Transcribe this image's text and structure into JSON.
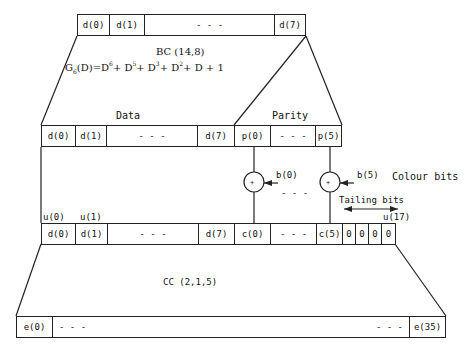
{
  "diagram": {
    "top_row": {
      "cells": [
        "d(0)",
        "d(1)",
        "- - -",
        "d(7)"
      ]
    },
    "bc_block": {
      "label": "BC (14,8)",
      "generator_prefix": "G",
      "generator_sub": "6",
      "generator_body": "(D)=D",
      "exp1": "6",
      "t1": "+ D",
      "exp2": "5",
      "t2": "+ D",
      "exp3": "3",
      "t3": "+ D",
      "exp4": "2",
      "t4": "+ D + 1"
    },
    "middle_row": {
      "data_label": "Data",
      "parity_label": "Parity",
      "cells": [
        "d(0)",
        "d(1)",
        "- - -",
        "d(7)",
        "p(0)",
        "- - -",
        "p(5)"
      ]
    },
    "xor": {
      "symbol": "+",
      "inputs": [
        "b(0)",
        "b(5)"
      ],
      "between": "- - -",
      "group_label": "Colour bits"
    },
    "tailing": {
      "label": "Tailing bits"
    },
    "lower_row": {
      "index_labels": [
        "u(0)",
        "u(1)",
        "u(17)"
      ],
      "cells": [
        "d(0)",
        "d(1)",
        "- - -",
        "d(7)",
        "c(0)",
        "- - -",
        "c(5)",
        "0",
        "0",
        "0",
        "0"
      ]
    },
    "cc_block": {
      "label": "CC (2,1,5)"
    },
    "bottom_row": {
      "cells": [
        "e(0)",
        "- - -",
        "- - -",
        "e(35)"
      ]
    },
    "colors": {
      "line": "#222222",
      "background": "#ffffff"
    }
  }
}
